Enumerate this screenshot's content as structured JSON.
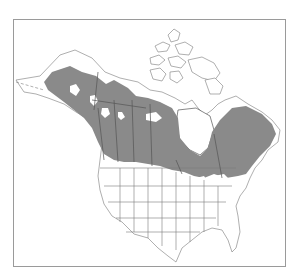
{
  "map": {
    "title": "",
    "region": "North America",
    "type": "species range map",
    "range_fill_color": "#8a8a8a",
    "background_color": "#ffffff",
    "border_color": "#9a9a9a",
    "legend": []
  }
}
